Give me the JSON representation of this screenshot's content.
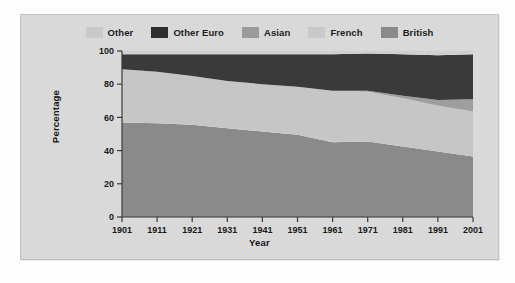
{
  "chart_data": {
    "type": "area",
    "title": "",
    "xlabel": "Year",
    "ylabel": "Percentage",
    "stacked": true,
    "normalized": true,
    "grid": true,
    "legend_position": "top",
    "xlim": [
      1901,
      2001
    ],
    "ylim": [
      0,
      100
    ],
    "yticks": [
      0,
      20,
      40,
      60,
      80,
      100
    ],
    "categories": [
      1901,
      1911,
      1921,
      1931,
      1941,
      1951,
      1961,
      1971,
      1981,
      1991,
      2001
    ],
    "xtick_labels": [
      "1901",
      "1911",
      "1921",
      "1931",
      "1941",
      "1951",
      "1961",
      "1971",
      "1981",
      "1991",
      "2001"
    ],
    "ytick_labels": [
      "0",
      "20",
      "40",
      "60",
      "80",
      "100"
    ],
    "series": [
      {
        "name": "British",
        "color": "#8a8a8a",
        "values": [
          57.0,
          56.5,
          55.5,
          53.5,
          51.5,
          49.5,
          45.0,
          45.5,
          42.5,
          39.5,
          36.5
        ]
      },
      {
        "name": "French",
        "color": "#c6c6c6",
        "values": [
          32.0,
          31.0,
          29.5,
          28.5,
          28.5,
          29.0,
          31.0,
          30.0,
          29.0,
          27.5,
          27.0
        ]
      },
      {
        "name": "Asian",
        "color": "#9e9e9e",
        "values": [
          0.0,
          0.0,
          0.0,
          0.0,
          0.0,
          0.0,
          0.0,
          0.5,
          1.5,
          3.5,
          7.5
        ]
      },
      {
        "name": "Other Euro",
        "color": "#3a3a3a",
        "values": [
          9.0,
          10.5,
          13.0,
          16.0,
          18.0,
          19.5,
          22.0,
          22.5,
          25.0,
          27.0,
          27.0
        ]
      },
      {
        "name": "Other",
        "color": "#d0d0d0",
        "values": [
          2.0,
          2.0,
          2.0,
          2.0,
          2.0,
          2.0,
          2.0,
          1.5,
          2.0,
          2.5,
          2.0
        ]
      }
    ],
    "legend_entries": [
      {
        "label": "Other",
        "color": "#c9c9c9"
      },
      {
        "label": "Other Euro",
        "color": "#2e2e2e"
      },
      {
        "label": "Asian",
        "color": "#9b9b9b"
      },
      {
        "label": "French",
        "color": "#c9c9c9"
      },
      {
        "label": "British",
        "color": "#8a8a8a"
      }
    ]
  },
  "colors": {
    "card_background": "#d9d9d9",
    "plot_background": "#ffffff",
    "axis": "#3a3a3a",
    "grid": "#cfcfcf",
    "page_background": "#fdfdfd"
  }
}
